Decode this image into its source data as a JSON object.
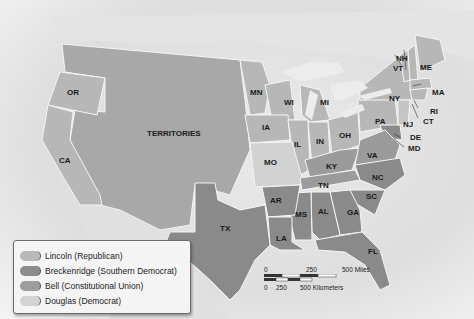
{
  "map": {
    "title_visible": false,
    "colors": {
      "lincoln": "#b7b7b7",
      "breckenridge": "#8a8a8a",
      "bell": "#9b9b9b",
      "douglas": "#d2d2d2",
      "territories": "#a8a8a8",
      "foreign": "#e2e2e2",
      "water": "#eeeeee",
      "border": "#f7f7f7"
    },
    "labels": {
      "OR": "OR",
      "CA": "CA",
      "TERRITORIES": "TERRITORIES",
      "TX": "TX",
      "MN": "MN",
      "WI": "WI",
      "MI": "MI",
      "IA": "IA",
      "IL": "IL",
      "IN": "IN",
      "OH": "OH",
      "MO": "MO",
      "KY": "KY",
      "VA": "VA",
      "TN": "TN",
      "NC": "NC",
      "SC": "SC",
      "AR": "AR",
      "MS": "MS",
      "AL": "AL",
      "GA": "GA",
      "LA": "LA",
      "FL": "FL",
      "PA": "PA",
      "NY": "NY",
      "NJ": "NJ",
      "DE": "DE",
      "MD": "MD",
      "CT": "CT",
      "RI": "RI",
      "MA": "MA",
      "VT": "VT",
      "NH": "NH",
      "ME": "ME"
    }
  },
  "legend": {
    "items": [
      {
        "label": "Lincoln (Republican)",
        "color": "#b9b9b9"
      },
      {
        "label": "Breckenridge (Southern Democrat)",
        "color": "#8c8c8c"
      },
      {
        "label": "Bell (Constitutional Union)",
        "color": "#9d9d9d"
      },
      {
        "label": "Douglas (Democrat)",
        "color": "#d3d3d3"
      }
    ]
  },
  "scale_bar": {
    "miles": {
      "zero": "0",
      "mid": "250",
      "max": "500 Miles"
    },
    "km": {
      "zero": "0",
      "mid": "250",
      "max": "500 Kilometers"
    }
  }
}
